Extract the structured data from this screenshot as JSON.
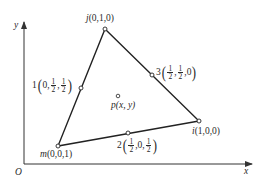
{
  "axes": {
    "x_label": "x",
    "y_label": "y",
    "origin_label": "O"
  },
  "vertices": {
    "j": {
      "name": "j",
      "coords": "(0,1,0)",
      "px": [
        105,
        29
      ]
    },
    "i": {
      "name": "i",
      "coords": "(1,0,0)",
      "px": [
        199,
        121
      ]
    },
    "m": {
      "name": "m",
      "coords": "(0,0,1)",
      "px": [
        58,
        146
      ]
    }
  },
  "midpoints": {
    "p1": {
      "index": "1",
      "parts": [
        "0",
        {
          "n": "1",
          "d": "2"
        },
        {
          "n": "1",
          "d": "2"
        }
      ],
      "px": [
        81,
        88
      ]
    },
    "p2": {
      "index": "2",
      "parts": [
        {
          "n": "1",
          "d": "2"
        },
        "0",
        {
          "n": "1",
          "d": "2"
        }
      ],
      "px": [
        128,
        133
      ]
    },
    "p3": {
      "index": "3",
      "parts": [
        {
          "n": "1",
          "d": "2"
        },
        {
          "n": "1",
          "d": "2"
        },
        "0"
      ],
      "px": [
        152,
        68
      ]
    }
  },
  "interior_point": {
    "name": "p",
    "coords": "(x, y)",
    "px": [
      118,
      96
    ]
  },
  "labels": {
    "j_name": "j",
    "j_coords": "(0,1,0)",
    "i_name": "i",
    "i_coords": "(1,0,0)",
    "m_name": "m",
    "m_coords": "(0,0,1)",
    "p_name": "p",
    "p_coords": "(x, y)",
    "mid1_index": "1",
    "mid2_index": "2",
    "mid3_index": "3",
    "zero": "0",
    "one": "1",
    "two": "2",
    "comma": ","
  }
}
